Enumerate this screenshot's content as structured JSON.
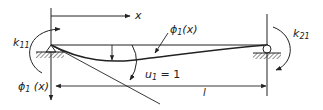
{
  "diagram": {
    "labels": {
      "x_axis": "x",
      "k11": "k",
      "k11_sub": "11",
      "k21": "k",
      "k21_sub": "21",
      "phi_curve": "ϕ",
      "phi_curve_sub": "1",
      "phi_curve_arg": "(x)",
      "phi_axis": "ϕ",
      "phi_axis_sub": "1",
      "phi_axis_arg": " (x)",
      "u1": "u",
      "u1_sub": "1",
      "u1_eq": " = 1",
      "length": "l"
    },
    "colors": {
      "line": "#222222",
      "background": "#ffffff"
    }
  }
}
